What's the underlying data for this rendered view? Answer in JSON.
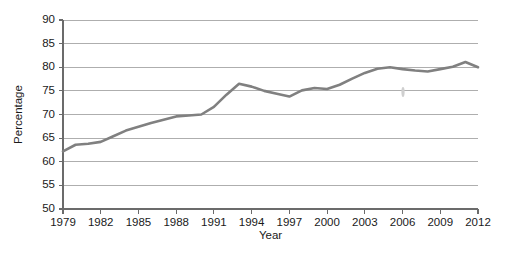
{
  "chart_data": {
    "type": "line",
    "title": "",
    "xlabel": "Year",
    "ylabel": "Percentage",
    "xlim": [
      1979,
      2012
    ],
    "ylim": [
      50,
      90
    ],
    "ytick_step": 5,
    "xtick_step": 3,
    "grid": "horizontal",
    "legend": "none",
    "line_color": "#808080",
    "gridline_color": "#9a9a9a",
    "axis_color": "#6b6b6b",
    "text_color": "#1a1a1a",
    "ytick_labels": [
      "50",
      "55",
      "60",
      "65",
      "70",
      "75",
      "80",
      "85",
      "90"
    ],
    "ytick_values": [
      50,
      55,
      60,
      65,
      70,
      75,
      80,
      85,
      90
    ],
    "xtick_labels": [
      "1979",
      "1982",
      "1985",
      "1988",
      "1991",
      "1994",
      "1997",
      "2000",
      "2003",
      "2006",
      "2009",
      "2012"
    ],
    "xtick_values": [
      1979,
      1982,
      1985,
      1988,
      1991,
      1994,
      1997,
      2000,
      2003,
      2006,
      2009,
      2012
    ],
    "x": [
      1979,
      1980,
      1981,
      1982,
      1983,
      1984,
      1985,
      1986,
      1987,
      1988,
      1989,
      1990,
      1991,
      1992,
      1993,
      1994,
      1995,
      1996,
      1997,
      1998,
      1999,
      2000,
      2001,
      2002,
      2003,
      2004,
      2005,
      2006,
      2007,
      2008,
      2009,
      2010,
      2011,
      2012
    ],
    "values": [
      62.2,
      63.6,
      63.8,
      64.2,
      65.4,
      66.6,
      67.4,
      68.2,
      68.9,
      69.6,
      69.8,
      70.0,
      71.6,
      74.2,
      76.5,
      75.9,
      75.0,
      74.4,
      73.8,
      75.1,
      75.6,
      75.4,
      76.3,
      77.6,
      78.8,
      79.7,
      80.0,
      79.6,
      79.3,
      79.1,
      79.6,
      80.1,
      81.1,
      80.0
    ],
    "series": [
      {
        "name": "Percentage",
        "values": [
          62.2,
          63.6,
          63.8,
          64.2,
          65.4,
          66.6,
          67.4,
          68.2,
          68.9,
          69.6,
          69.8,
          70.0,
          71.6,
          74.2,
          76.5,
          75.9,
          75.0,
          74.4,
          73.8,
          75.1,
          75.6,
          75.4,
          76.3,
          77.6,
          78.8,
          79.7,
          80.0,
          79.6,
          79.3,
          79.1,
          79.6,
          80.1,
          81.1,
          80.0
        ]
      }
    ]
  },
  "layout": {
    "plot_left": 63,
    "plot_right": 478,
    "plot_top": 20,
    "plot_bottom": 209
  }
}
